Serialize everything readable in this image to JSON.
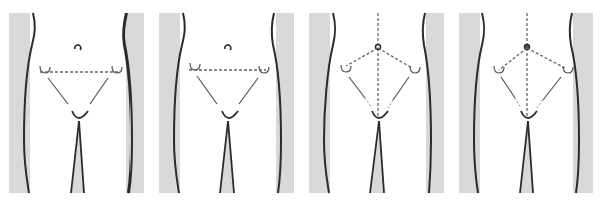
{
  "figure": {
    "colors": {
      "background": "#ffffff",
      "shading": "#d9d9d9",
      "outline": "#2b2b2b",
      "dashed": "#666666"
    },
    "panels": [
      {
        "id": 1,
        "label": "",
        "variant": "horizontal-line",
        "navel_style": "open"
      },
      {
        "id": 2,
        "label": "",
        "variant": "horizontal-line",
        "navel_style": "open"
      },
      {
        "id": 3,
        "label": "",
        "variant": "navel-to-spines",
        "navel_style": "ring"
      },
      {
        "id": 4,
        "label": "",
        "variant": "navel-to-spines",
        "navel_style": "filled"
      }
    ]
  }
}
